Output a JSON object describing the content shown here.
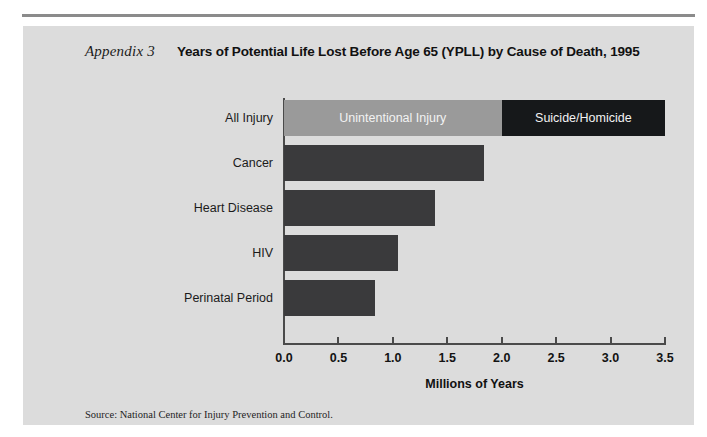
{
  "page": {
    "background": "#ffffff",
    "panel_color": "#dcdcdc",
    "rule_color": "#8b8b8b"
  },
  "header": {
    "appendix_label": "Appendix 3",
    "title": "Years of Potential Life Lost Before Age 65 (YPLL) by Cause of Death, 1995"
  },
  "source": {
    "text": "Source: National Center for Injury Prevention and Control."
  },
  "chart_data": {
    "type": "bar",
    "orientation": "horizontal",
    "title": "Years of Potential Life Lost Before Age 65 (YPLL) by Cause of Death, 1995",
    "xlabel": "Millions of Years",
    "ylabel": "",
    "xlim": [
      0.0,
      3.5
    ],
    "grid": false,
    "legend_position": "inside-bars",
    "tick_labels": [
      "0.0",
      "0.5",
      "1.0",
      "1.5",
      "2.0",
      "2.5",
      "3.0",
      "3.5"
    ],
    "ticks": [
      0.0,
      0.5,
      1.0,
      1.5,
      2.0,
      2.5,
      3.0,
      3.5
    ],
    "categories": [
      "All Injury",
      "Cancer",
      "Heart Disease",
      "HIV",
      "Perinatal Period"
    ],
    "values": [
      3.5,
      1.84,
      1.39,
      1.05,
      0.84
    ],
    "bars": [
      {
        "category": "All Injury",
        "total": 3.5,
        "stacked": true,
        "segments": [
          {
            "label": "Unintentional Injury",
            "value": 2.0,
            "color": "#9a9a9a"
          },
          {
            "label": "Suicide/Homicide",
            "value": 1.5,
            "color": "#16181a"
          }
        ]
      },
      {
        "category": "Cancer",
        "total": 1.84,
        "stacked": false,
        "segments": [
          {
            "label": "",
            "value": 1.84,
            "color": "#3a3a3c"
          }
        ]
      },
      {
        "category": "Heart Disease",
        "total": 1.39,
        "stacked": false,
        "segments": [
          {
            "label": "",
            "value": 1.39,
            "color": "#3a3a3c"
          }
        ]
      },
      {
        "category": "HIV",
        "total": 1.05,
        "stacked": false,
        "segments": [
          {
            "label": "",
            "value": 1.05,
            "color": "#3a3a3c"
          }
        ]
      },
      {
        "category": "Perinatal Period",
        "total": 0.84,
        "stacked": false,
        "segments": [
          {
            "label": "",
            "value": 0.84,
            "color": "#3a3a3c"
          }
        ]
      }
    ],
    "legend": [
      {
        "label": "Unintentional Injury",
        "color": "#9a9a9a"
      },
      {
        "label": "Suicide/Homicide",
        "color": "#16181a"
      }
    ]
  },
  "geometry": {
    "axis_x0": 261,
    "axis_x1": 642,
    "axis_y": 317,
    "bar_top_first": 74,
    "bar_height": 36,
    "bar_pitch": 45,
    "label_right": 250
  }
}
